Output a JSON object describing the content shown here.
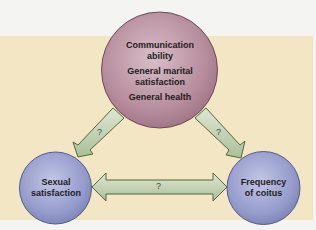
{
  "diagram": {
    "type": "relationship-triangle",
    "nodes": {
      "top": {
        "lines": [
          "Communication",
          "ability",
          "General marital",
          "satisfaction",
          "General health"
        ],
        "items": [
          "Communication ability",
          "General marital satisfaction",
          "General health"
        ],
        "color": "#b8909e"
      },
      "bottom_left": {
        "lines": [
          "Sexual",
          "satisfaction"
        ],
        "label": "Sexual satisfaction",
        "color": "#9aa0cc"
      },
      "bottom_right": {
        "lines": [
          "Frequency",
          "of coitus"
        ],
        "label": "Frequency of coitus",
        "color": "#9aa0cc"
      }
    },
    "edges": [
      {
        "from": "top",
        "to": "bottom_left",
        "label": "?",
        "direction": "one-way"
      },
      {
        "from": "top",
        "to": "bottom_right",
        "label": "?",
        "direction": "one-way"
      },
      {
        "from": "bottom_left",
        "to": "bottom_right",
        "label": "?",
        "direction": "two-way"
      }
    ],
    "colors": {
      "background_panel": "#f3e6c4",
      "arrow_fill": "#bfd0b0",
      "arrow_stroke": "#4a5a40"
    }
  }
}
